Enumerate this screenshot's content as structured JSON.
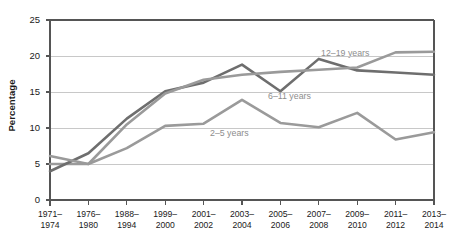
{
  "chart_data": {
    "type": "line",
    "title": "",
    "subtitle": "",
    "xlabel": "",
    "ylabel": "Percentage",
    "ylim": [
      0,
      25
    ],
    "yticks": [
      0,
      5,
      10,
      15,
      20,
      25
    ],
    "ytick_labels": [
      "0",
      "5",
      "10",
      "15",
      "20",
      "25"
    ],
    "grid": true,
    "grid_axis": "y",
    "legend_position": "inline-annotations",
    "categories": [
      "1971–\n1974",
      "1976–\n1980",
      "1988–\n1994",
      "1999–\n2000",
      "2001–\n2002",
      "2003–\n2004",
      "2005–\n2006",
      "2007–\n2008",
      "2009–\n2010",
      "2011–\n2012",
      "2013–\n2014"
    ],
    "categories_line1": [
      "1971–",
      "1976–",
      "1988–",
      "1999–",
      "2001–",
      "2003–",
      "2005–",
      "2007–",
      "2009–",
      "2011–",
      "2013–"
    ],
    "categories_line2": [
      "1974",
      "1980",
      "1994",
      "2000",
      "2002",
      "2004",
      "2006",
      "2008",
      "2010",
      "2012",
      "2014"
    ],
    "series": [
      {
        "name": "2–5 years",
        "color": "#9a9a9a",
        "values": [
          5.0,
          5.0,
          7.2,
          10.3,
          10.6,
          13.9,
          10.7,
          10.1,
          12.1,
          8.4,
          9.4
        ]
      },
      {
        "name": "6–11 years",
        "color": "#6e6e6e",
        "values": [
          4.0,
          6.5,
          11.3,
          15.1,
          16.3,
          18.8,
          15.1,
          19.6,
          18.0,
          17.7,
          17.4
        ]
      },
      {
        "name": "12–19 years",
        "color": "#9a9a9a",
        "values": [
          6.1,
          5.0,
          10.5,
          14.8,
          16.7,
          17.4,
          17.8,
          18.1,
          18.4,
          20.5,
          20.6
        ]
      }
    ],
    "annotations": [
      {
        "text": "12–19 years",
        "series": "12–19 years",
        "x_px": 318,
        "y_px": 48
      },
      {
        "text": "6–11 years",
        "series": "6–11 years",
        "x_px": 265,
        "y_px": 91
      },
      {
        "text": "2–5 years",
        "series": "2–5 years",
        "x_px": 207,
        "y_px": 128
      }
    ],
    "colors": {
      "axis": "#555555",
      "gridline": "#c8c8c8",
      "text": "#1a1a1a",
      "annotation_text": "#8d8d8d",
      "background": "#ffffff"
    }
  }
}
